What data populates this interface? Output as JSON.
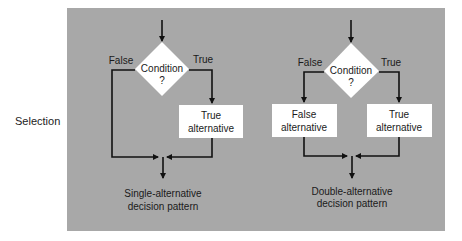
{
  "side_label": "Selection",
  "colors": {
    "panel": "#a8a8a8",
    "line": "#111111",
    "box": "#ffffff",
    "text": "#1a1a1a"
  },
  "single": {
    "condition_line1": "Condition",
    "condition_line2": "?",
    "false_label": "False",
    "true_label": "True",
    "true_box_line1": "True",
    "true_box_line2": "alternative",
    "caption_line1": "Single-alternative",
    "caption_line2": "decision pattern"
  },
  "double": {
    "condition_line1": "Condition",
    "condition_line2": "?",
    "false_label": "False",
    "true_label": "True",
    "false_box_line1": "False",
    "false_box_line2": "alternative",
    "true_box_line1": "True",
    "true_box_line2": "alternative",
    "caption_line1": "Double-alternative",
    "caption_line2": "decision pattern"
  }
}
